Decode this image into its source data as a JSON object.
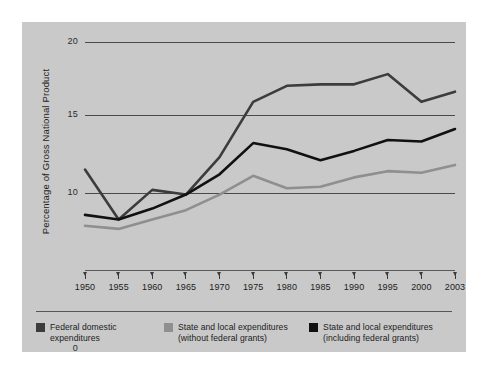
{
  "figure": {
    "background": "#ffffff",
    "panel_color": "#c9c9c9"
  },
  "chart_data": {
    "type": "line",
    "title": "",
    "xlabel": "",
    "ylabel": "Percentage of Gross National Product",
    "x": [
      1950,
      1955,
      1960,
      1965,
      1970,
      1975,
      1980,
      1985,
      1990,
      1995,
      2000,
      2003
    ],
    "categories": [
      "1950",
      "1955",
      "1960",
      "1965",
      "1970",
      "1975",
      "1980",
      "1985",
      "1990",
      "1995",
      "2000",
      "2003"
    ],
    "ytick_labels": [
      "0",
      "10",
      "15",
      "20"
    ],
    "ytick_values": [
      0,
      10,
      15,
      20
    ],
    "ylim": [
      0,
      20
    ],
    "broken_axis": true,
    "grid": true,
    "gridlines_at": [
      10,
      15,
      20
    ],
    "legend_position": "bottom",
    "series": [
      {
        "name": "Federal domestic expenditures",
        "color": "#3c3c3c",
        "values": [
          11.5,
          8.3,
          10.2,
          9.9,
          12.3,
          15.9,
          17.0,
          17.1,
          17.1,
          17.8,
          15.9,
          16.6
        ]
      },
      {
        "name": "State and local expenditures (without federal grants)",
        "color": "#8f8f8f",
        "values": [
          7.9,
          7.7,
          8.3,
          8.9,
          9.9,
          11.1,
          10.3,
          10.4,
          11.0,
          11.4,
          11.3,
          11.8
        ]
      },
      {
        "name": "State and local expenditures (including federal grants)",
        "color": "#111111",
        "values": [
          8.6,
          8.3,
          9.0,
          9.9,
          11.2,
          13.2,
          12.8,
          12.1,
          12.7,
          13.4,
          13.3,
          14.1
        ]
      }
    ]
  },
  "legend": {
    "items": [
      {
        "label_line1": "Federal domestic",
        "label_line2": "expenditures",
        "color": "#3c3c3c",
        "swatch_name": "federal-domestic-swatch"
      },
      {
        "label_line1": "State and local expenditures",
        "label_line2": "(without federal grants)",
        "color": "#8f8f8f",
        "swatch_name": "state-local-without-grants-swatch"
      },
      {
        "label_line1": "State and local expenditures",
        "label_line2": "(including federal grants)",
        "color": "#111111",
        "swatch_name": "state-local-including-grants-swatch"
      }
    ]
  }
}
